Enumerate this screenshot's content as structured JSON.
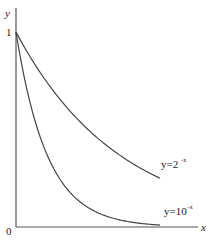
{
  "chart_data": {
    "type": "line",
    "title": "",
    "xlabel": "x",
    "ylabel": "y",
    "xlim": [
      0,
      2.55
    ],
    "ylim": [
      0,
      1.12
    ],
    "grid": false,
    "legend": "inline labels at curve ends",
    "ticks": {
      "y": [
        {
          "value": 1,
          "label": "1"
        }
      ],
      "origin": "0"
    },
    "series": [
      {
        "name": "y=2^-x",
        "label_base": "y=2",
        "label_exp": "-x",
        "function": "2^-x",
        "x": [
          0,
          0.25,
          0.5,
          0.75,
          1,
          1.25,
          1.5,
          1.75,
          2
        ],
        "values": [
          1,
          0.841,
          0.707,
          0.595,
          0.5,
          0.42,
          0.354,
          0.297,
          0.25
        ]
      },
      {
        "name": "y=10^-x",
        "label_base": "y=10",
        "label_exp": "-x",
        "function": "10^-x",
        "x": [
          0,
          0.25,
          0.5,
          0.75,
          1,
          1.25,
          1.5,
          1.75,
          2
        ],
        "values": [
          1,
          0.562,
          0.316,
          0.178,
          0.1,
          0.056,
          0.032,
          0.018,
          0.01
        ]
      }
    ]
  },
  "style": {
    "axis_color": "#555555",
    "curve_color": "#444444",
    "text_color": "#222222"
  }
}
